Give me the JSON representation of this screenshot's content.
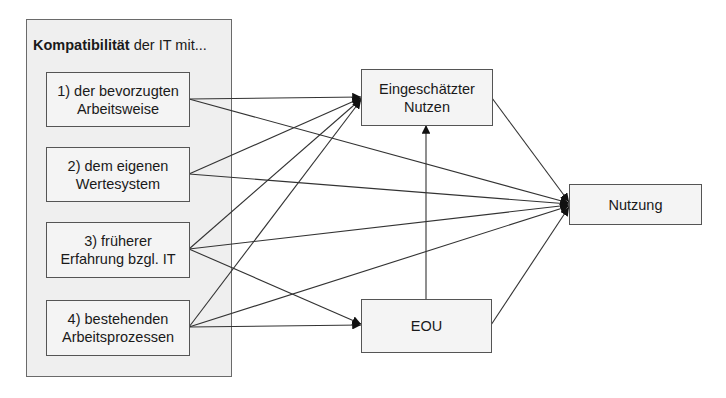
{
  "group": {
    "title_bold": "Kompatibilität",
    "title_rest": " der IT mit...",
    "items": [
      {
        "label": "1) der bevorzugten\nArbeitsweise"
      },
      {
        "label": "2) dem eigenen\nWertesystem"
      },
      {
        "label": "3) früherer\nErfahrung bzgl. IT"
      },
      {
        "label": "4) bestehenden\nArbeitsprozessen"
      }
    ]
  },
  "nodes": {
    "nutzen": {
      "label": "Eingeschätzter\nNutzen"
    },
    "eou": {
      "label": "EOU"
    },
    "nutzung": {
      "label": "Nutzung"
    }
  },
  "edges": [
    {
      "from": "1",
      "to": "Eingeschätzter Nutzen"
    },
    {
      "from": "1",
      "to": "Nutzung"
    },
    {
      "from": "2",
      "to": "Eingeschätzter Nutzen"
    },
    {
      "from": "2",
      "to": "Nutzung"
    },
    {
      "from": "3",
      "to": "Eingeschätzter Nutzen"
    },
    {
      "from": "3",
      "to": "Nutzung"
    },
    {
      "from": "3",
      "to": "EOU"
    },
    {
      "from": "4",
      "to": "Eingeschätzter Nutzen"
    },
    {
      "from": "4",
      "to": "Nutzung"
    },
    {
      "from": "4",
      "to": "EOU"
    },
    {
      "from": "EOU",
      "to": "Eingeschätzter Nutzen"
    },
    {
      "from": "Eingeschätzter Nutzen",
      "to": "Nutzung"
    },
    {
      "from": "EOU",
      "to": "Nutzung"
    }
  ],
  "colors": {
    "group_bg": "#efefef",
    "box_bg": "#f4f4f4",
    "line": "#333333"
  }
}
